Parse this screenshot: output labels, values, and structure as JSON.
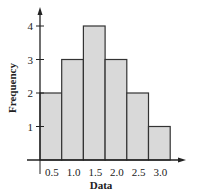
{
  "chart_data": {
    "type": "bar",
    "subtype": "histogram",
    "title": "",
    "xlabel": "Data",
    "ylabel": "Frequency",
    "categories": [
      "0.5",
      "1.0",
      "1.5",
      "2.0",
      "2.5",
      "3.0"
    ],
    "values": [
      2,
      3,
      4,
      3,
      2,
      1
    ],
    "y_ticks": [
      "1",
      "2",
      "3",
      "4"
    ],
    "ylim": [
      0,
      4.5
    ],
    "grid": false,
    "legend": null,
    "colors": {
      "bar_fill": "#d9d9d9",
      "bar_edge": "#333333",
      "axis": "#222222"
    }
  }
}
